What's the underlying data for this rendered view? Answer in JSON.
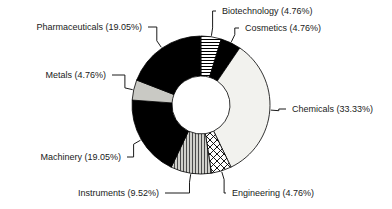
{
  "chart_data": {
    "type": "pie",
    "variant": "donut",
    "title": "",
    "subtitle": "",
    "xlabel": "",
    "ylabel": "",
    "legend_position": "none",
    "label_format": "name (percent%)",
    "grid": false,
    "total_percent": 100.0,
    "categories": [
      "Biotechnology",
      "Cosmetics",
      "Chemicals",
      "Engineering",
      "Instruments",
      "Machinery",
      "Metals",
      "Pharmaceuticals"
    ],
    "values": [
      4.76,
      4.76,
      33.33,
      4.76,
      9.52,
      19.05,
      4.76,
      19.05
    ],
    "slices": [
      {
        "name": "Biotechnology",
        "percent": 4.76,
        "label": "Biotechnology (4.76%)",
        "fill": "horizontal-hatch",
        "color": "#ffffff",
        "start_angle": 0.0,
        "end_angle": 17.1,
        "label_x": 222,
        "label_y": 14,
        "label_anchor": "start"
      },
      {
        "name": "Cosmetics",
        "percent": 4.76,
        "label": "Cosmetics (4.76%)",
        "fill": "solid-black",
        "color": "#000000",
        "start_angle": 17.1,
        "end_angle": 34.2,
        "label_x": 245,
        "label_y": 31,
        "label_anchor": "start"
      },
      {
        "name": "Chemicals",
        "percent": 33.33,
        "label": "Chemicals (33.33%)",
        "fill": "solid-white",
        "color": "#f2f2ee",
        "start_angle": 34.2,
        "end_angle": 154.2,
        "label_x": 292,
        "label_y": 112,
        "label_anchor": "start"
      },
      {
        "name": "Engineering",
        "percent": 4.76,
        "label": "Engineering (4.76%)",
        "fill": "cross-hatch",
        "color": "#ffffff",
        "start_angle": 154.2,
        "end_angle": 171.3,
        "label_x": 232,
        "label_y": 196,
        "label_anchor": "start"
      },
      {
        "name": "Instruments",
        "percent": 9.52,
        "label": "Instruments (9.52%)",
        "fill": "vertical-hatch",
        "color": "#c9c9c4",
        "start_angle": 171.3,
        "end_angle": 205.6,
        "label_x": 159,
        "label_y": 196,
        "label_anchor": "end"
      },
      {
        "name": "Machinery",
        "percent": 19.05,
        "label": "Machinery (19.05%)",
        "fill": "solid-black",
        "color": "#000000",
        "start_angle": 205.6,
        "end_angle": 274.1,
        "label_x": 121,
        "label_y": 160,
        "label_anchor": "end"
      },
      {
        "name": "Metals",
        "percent": 4.76,
        "label": "Metals (4.76%)",
        "fill": "solid-gray",
        "color": "#c9c9c4",
        "start_angle": 274.1,
        "end_angle": 291.2,
        "label_x": 106,
        "label_y": 78,
        "label_anchor": "end"
      },
      {
        "name": "Pharmaceuticals",
        "percent": 19.05,
        "label": "Pharmaceuticals (19.05%)",
        "fill": "solid-black",
        "color": "#000000",
        "start_angle": 291.2,
        "end_angle": 359.7,
        "label_x": 142,
        "label_y": 30,
        "label_anchor": "end"
      }
    ],
    "geometry": {
      "center_x": 201,
      "center_y": 105,
      "outer_radius": 69,
      "inner_radius": 29
    },
    "colors": {
      "black": "#000000",
      "white": "#f2f2ee",
      "gray": "#c9c9c4",
      "outline": "#000000",
      "text": "#1a1a1a",
      "background": "#ffffff"
    }
  },
  "labels": {
    "biotechnology": "Biotechnology (4.76%)",
    "cosmetics": "Cosmetics (4.76%)",
    "chemicals": "Chemicals (33.33%)",
    "engineering": "Engineering (4.76%)",
    "instruments": "Instruments (9.52%)",
    "machinery": "Machinery (19.05%)",
    "metals": "Metals (4.76%)",
    "pharmaceuticals": "Pharmaceuticals (19.05%)"
  }
}
